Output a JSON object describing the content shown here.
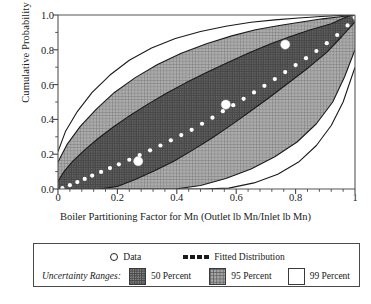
{
  "chart_data": {
    "type": "area",
    "title": "",
    "xlabel": "Boiler Partitioning Factor for Mn (Outlet lb Mn/Inlet lb Mn)",
    "ylabel": "Cumulative Probability",
    "xlim": [
      0,
      1
    ],
    "ylim": [
      0,
      1
    ],
    "grid": false,
    "x_ticks": [
      "0",
      "0.2",
      "0.4",
      "0.6",
      "0.8",
      "1"
    ],
    "x_tick_values": [
      0,
      0.2,
      0.4,
      0.6,
      0.8,
      1
    ],
    "y_ticks": [
      "0.0",
      "0.2",
      "0.4",
      "0.6",
      "0.8",
      "1.0"
    ],
    "y_tick_values": [
      0,
      0.2,
      0.4,
      0.6,
      0.8,
      1
    ],
    "x_minor_tick_count": 4,
    "y_minor_tick_count": 1,
    "legend_position": "below-plot",
    "series": [
      {
        "name": "Fitted Distribution",
        "type": "line",
        "style": "dotted-white",
        "x": [
          0.015,
          0.04,
          0.065,
          0.09,
          0.115,
          0.145,
          0.175,
          0.205,
          0.24,
          0.275,
          0.31,
          0.345,
          0.38,
          0.415,
          0.45,
          0.485,
          0.52,
          0.555,
          0.59,
          0.625,
          0.66,
          0.695,
          0.73,
          0.765,
          0.8,
          0.835,
          0.87,
          0.905,
          0.94,
          0.975,
          1.0
        ],
        "y": [
          0.005,
          0.022,
          0.04,
          0.058,
          0.077,
          0.098,
          0.12,
          0.142,
          0.168,
          0.195,
          0.222,
          0.25,
          0.28,
          0.31,
          0.34,
          0.375,
          0.41,
          0.447,
          0.482,
          0.518,
          0.555,
          0.593,
          0.632,
          0.672,
          0.712,
          0.752,
          0.793,
          0.838,
          0.885,
          0.94,
          0.985
        ]
      },
      {
        "name": "Data",
        "type": "scatter",
        "marker": "filled-white-circle",
        "x": [
          0.27,
          0.565,
          0.765
        ],
        "y": [
          0.16,
          0.485,
          0.83
        ]
      },
      {
        "name": "50 Percent",
        "type": "band",
        "fill": "#474747",
        "texture": "dots",
        "lower_x": [
          0.0,
          0.035,
          0.08,
          0.14,
          0.2,
          0.26,
          0.325,
          0.39,
          0.455,
          0.52,
          0.585,
          0.65,
          0.715,
          0.78,
          0.845,
          0.905,
          0.955,
          1.0
        ],
        "lower_y": [
          0.0,
          0.0,
          0.0,
          0.0,
          0.015,
          0.055,
          0.105,
          0.16,
          0.225,
          0.295,
          0.37,
          0.45,
          0.53,
          0.615,
          0.7,
          0.785,
          0.875,
          0.96
        ],
        "upper_x": [
          0.0,
          0.02,
          0.05,
          0.09,
          0.135,
          0.185,
          0.24,
          0.3,
          0.365,
          0.43,
          0.5,
          0.57,
          0.64,
          0.71,
          0.78,
          0.85,
          0.92,
          0.985
        ],
        "upper_y": [
          0.045,
          0.1,
          0.16,
          0.225,
          0.29,
          0.355,
          0.42,
          0.485,
          0.55,
          0.61,
          0.67,
          0.725,
          0.78,
          0.83,
          0.875,
          0.915,
          0.95,
          1.0
        ]
      },
      {
        "name": "95 Percent",
        "type": "band",
        "fill": "#a6a6a6",
        "texture": "crosshatch",
        "lower_x": [
          0.0,
          0.06,
          0.14,
          0.225,
          0.31,
          0.395,
          0.48,
          0.565,
          0.65,
          0.73,
          0.805,
          0.87,
          0.925,
          0.965,
          1.0
        ],
        "lower_y": [
          0.0,
          0.0,
          0.0,
          0.0,
          0.0,
          0.0,
          0.02,
          0.06,
          0.115,
          0.185,
          0.27,
          0.375,
          0.5,
          0.645,
          0.8
        ],
        "upper_x": [
          0.0,
          0.03,
          0.075,
          0.13,
          0.19,
          0.26,
          0.335,
          0.415,
          0.5,
          0.585,
          0.665,
          0.745,
          0.82,
          0.89,
          0.95,
          1.0
        ],
        "upper_y": [
          0.155,
          0.255,
          0.36,
          0.46,
          0.555,
          0.64,
          0.715,
          0.78,
          0.835,
          0.88,
          0.915,
          0.94,
          0.96,
          0.978,
          0.99,
          1.0
        ]
      },
      {
        "name": "99 Percent",
        "type": "band",
        "fill": "#ffffff",
        "texture": "none",
        "lower_x": [
          0.0,
          0.09,
          0.19,
          0.29,
          0.39,
          0.485,
          0.575,
          0.66,
          0.74,
          0.81,
          0.87,
          0.92,
          0.96,
          1.0
        ],
        "lower_y": [
          0.0,
          0.0,
          0.0,
          0.0,
          0.0,
          0.0,
          0.005,
          0.035,
          0.085,
          0.155,
          0.25,
          0.365,
          0.5,
          0.7
        ],
        "upper_x": [
          0.0,
          0.025,
          0.065,
          0.115,
          0.175,
          0.24,
          0.315,
          0.395,
          0.48,
          0.565,
          0.65,
          0.73,
          0.81,
          0.885,
          0.95,
          1.0
        ],
        "upper_y": [
          0.215,
          0.33,
          0.445,
          0.555,
          0.655,
          0.74,
          0.81,
          0.865,
          0.905,
          0.935,
          0.958,
          0.972,
          0.983,
          0.991,
          0.997,
          1.0
        ]
      }
    ],
    "legend": {
      "data_label": "Data",
      "fitted_label": "Fitted Distribution",
      "uncertainty_title": "Uncertainty Ranges:",
      "range_labels": [
        "50 Percent",
        "95 Percent",
        "99 Percent"
      ]
    },
    "colors": {
      "band_50": "#474747",
      "band_95": "#a6a6a6",
      "band_99": "#ffffff",
      "outline": "#1a1a1a",
      "fitted_line": "#ffffff",
      "data_marker": "#ffffff"
    }
  }
}
